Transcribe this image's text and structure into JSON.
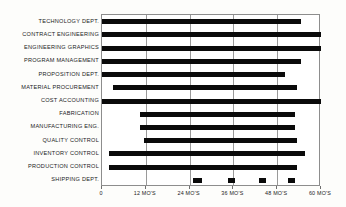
{
  "chart_data": {
    "type": "bar",
    "orientation": "horizontal",
    "subtype": "gantt",
    "title": "",
    "xlabel": "",
    "ylabel": "",
    "xlim": [
      0,
      60
    ],
    "grid": true,
    "legend": null,
    "xticks": [
      0,
      12,
      24,
      36,
      48,
      60
    ],
    "xtick_labels": [
      "0",
      "12 MO'S",
      "24 MO'S",
      "36 MO'S",
      "48 MO'S",
      "60 MO'S"
    ],
    "units": "months",
    "categories": [
      "TECHNOLOGY DEPT.",
      "CONTRACT ENGINEERING",
      "ENGINEERING GRAPHICS",
      "PROGRAM MANAGEMENT",
      "PROPOSITION DEPT.",
      "MATERIAL PROCUREMENT",
      "COST ACCOUNTING",
      "FABRICATION",
      "MANUFACTURING ENG.",
      "QUALITY CONTROL",
      "INVENTORY CONTROL",
      "PRODUCTION CONTROL",
      "SHIPPING DEPT."
    ],
    "bars": [
      {
        "label": "TECHNOLOGY DEPT.",
        "start": 0,
        "end": 54.5
      },
      {
        "label": "CONTRACT ENGINEERING",
        "start": 0,
        "end": 60
      },
      {
        "label": "ENGINEERING GRAPHICS",
        "start": 0,
        "end": 60
      },
      {
        "label": "PROGRAM MANAGEMENT",
        "start": 0,
        "end": 54.5
      },
      {
        "label": "PROPOSITION DEPT.",
        "start": 0,
        "end": 50
      },
      {
        "label": "MATERIAL PROCUREMENT",
        "start": 3,
        "end": 53.5
      },
      {
        "label": "COST ACCOUNTING",
        "start": 0,
        "end": 60
      },
      {
        "label": "FABRICATION",
        "start": 10.5,
        "end": 53
      },
      {
        "label": "MANUFACTURING ENG.",
        "start": 10.5,
        "end": 53
      },
      {
        "label": "QUALITY CONTROL",
        "start": 11.5,
        "end": 53.5
      },
      {
        "label": "INVENTORY CONTROL",
        "start": 2,
        "end": 55.5
      },
      {
        "label": "PRODUCTION CONTROL",
        "start": 2,
        "end": 53.5
      }
    ],
    "milestones": {
      "label": "SHIPPING DEPT.",
      "blocks": [
        {
          "start": 25,
          "end": 27.5
        },
        {
          "start": 34.5,
          "end": 36.5
        },
        {
          "start": 43,
          "end": 45
        },
        {
          "start": 51,
          "end": 53
        }
      ]
    }
  }
}
